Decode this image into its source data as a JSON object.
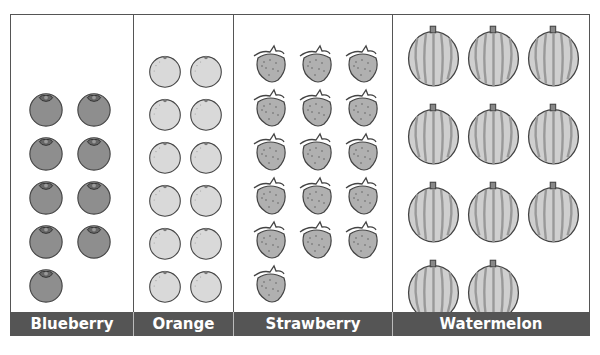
{
  "chart_data": {
    "type": "pictograph",
    "title": "",
    "categories": [
      "Blueberry",
      "Orange",
      "Strawberry",
      "Watermelon"
    ],
    "values": [
      9,
      12,
      16,
      11
    ],
    "xlabel": "",
    "ylabel": "",
    "icons": [
      "blueberry-icon",
      "orange-icon",
      "strawberry-icon",
      "watermelon-icon"
    ]
  },
  "columns": [
    {
      "label": "Blueberry",
      "count": 9,
      "icon": "blueberry",
      "left": 0,
      "width": 123,
      "cols": 2,
      "size": 38,
      "gapx": 10,
      "gapy": 6,
      "padx": 16,
      "fill": "#8e8e8e"
    },
    {
      "label": "Orange",
      "count": 12,
      "icon": "orange",
      "left": 123,
      "width": 100,
      "cols": 2,
      "size": 36,
      "gapx": 5,
      "gapy": 7,
      "padx": 13,
      "fill": "#d9d9d9"
    },
    {
      "label": "Strawberry",
      "count": 16,
      "icon": "strawberry",
      "left": 223,
      "width": 159,
      "cols": 3,
      "size": 40,
      "gapx": 6,
      "gapy": 4,
      "padx": 16,
      "fill": "#b0b0b0"
    },
    {
      "label": "Watermelon",
      "count": 11,
      "icon": "watermelon",
      "left": 382,
      "width": 198,
      "cols": 3,
      "size": 55,
      "gapx": 5,
      "gapy": 13,
      "padx": 13,
      "fill": "#cfcfcf"
    }
  ],
  "colors": {
    "label_bar": "#555555",
    "border": "#555555",
    "label_text": "#ffffff"
  }
}
